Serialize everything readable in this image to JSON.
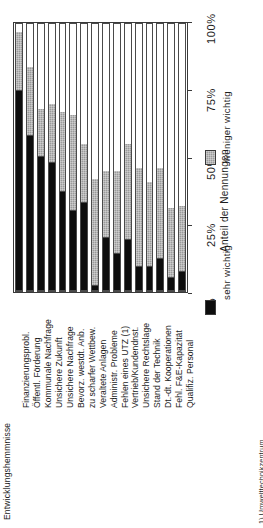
{
  "figure": {
    "title_clipped": "Entwicklungshemmnisse",
    "footnote": "1) Umwelttechnikzentrum"
  },
  "axis": {
    "title": "Anteil der Nennungen",
    "ticks": [
      "0%",
      "25%",
      "50%",
      "75%",
      "100%"
    ],
    "min": 0,
    "max": 100
  },
  "legend": {
    "items": [
      {
        "label": "sehr wichtig",
        "color": "#0d0d0d",
        "swatch": "black-swatch"
      },
      {
        "label": "weniger wichtig",
        "color": "#9a9a9a",
        "swatch": "gray-hatched-swatch"
      }
    ]
  },
  "chart_data": {
    "type": "bar",
    "orientation": "vertical-stacked-rotated",
    "title": "Entwicklungshemmnisse",
    "xlabel": "",
    "ylabel": "Anteil der Nennungen",
    "ylim": [
      0,
      100
    ],
    "grid": false,
    "stacked": true,
    "legend_position": "bottom-right",
    "categories": [
      "Finanzierungsprobl.",
      "Öffentl. Förderung",
      "Kommunale Nachfrage",
      "Unsichere Zukunft",
      "Unsichere Nachfrage",
      "Bevorz. westdt. Anb.",
      "zu scharfer Wettbew.",
      "Veraltete Anlagen",
      "Administr. Probleme",
      "Fehlen eines UTZ (1)",
      "Vertrieb/Kundendnst.",
      "Unsichere Rechtslage",
      "Stand der Technik",
      "Dt.-dt. Kooperationen",
      "Fehl. F&E-Kapazität",
      "Qualifiz. Personal"
    ],
    "series": [
      {
        "name": "sehr wichtig",
        "color": "#0d0d0d",
        "values": [
          75,
          58,
          50,
          48,
          37,
          30,
          33,
          2,
          20,
          14,
          19,
          9,
          9,
          12,
          5,
          7
        ]
      },
      {
        "name": "weniger wichtig",
        "color": "#9a9a9a",
        "values": [
          22,
          26,
          18,
          22,
          30,
          36,
          22,
          40,
          25,
          31,
          36,
          37,
          32,
          34,
          26,
          25
        ]
      }
    ]
  },
  "categories_display": [
    "Finanzierungsprobl.",
    "Öffentl. Förderung",
    "Kommunale Nachfrage",
    "Unsichere Zukunft",
    "Unsichere Nachfrage",
    "Bevorz. westdt. Anb.",
    "zu scharfer Wettbew.",
    "Veraltete Anlagen",
    "Administr. Probleme",
    "Fehlen eines UTZ (1)",
    "Vertrieb/Kundendnst.",
    "Unsichere Rechtslage",
    "Stand der Technik",
    "Dt.-dt. Kooperationen",
    "Fehl. F&E-Kapazität",
    "Qualifiz. Personal"
  ]
}
